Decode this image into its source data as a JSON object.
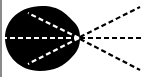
{
  "diagram": {
    "colors": {
      "blob": "#000000",
      "inner_rays": "#ffffff",
      "outer_rays": "#000000",
      "border": "#8a8a8a",
      "background": "#ffffff"
    },
    "focal_point": [
      77,
      38
    ],
    "inner_ray_ends": [
      [
        26,
        13
      ],
      [
        3,
        38
      ],
      [
        26,
        64
      ]
    ],
    "outer_ray_ends": [
      [
        138,
        7
      ],
      [
        142,
        38
      ],
      [
        138,
        70
      ]
    ]
  }
}
